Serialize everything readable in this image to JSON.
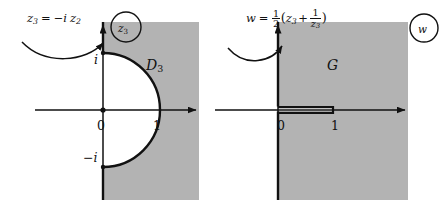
{
  "diagram": {
    "colors": {
      "region_fill": "#b3b3b3",
      "stroke": "#111111",
      "background": "#ffffff"
    },
    "panels": [
      {
        "id": "left",
        "plane_badge": "z3",
        "region_label": "D3",
        "transform_label": "z3 = -i z2",
        "transform_parts": {
          "lhs_base": "z",
          "lhs_sub": "3",
          "equals": "=",
          "minus_i": "−i",
          "rhs_base": "z",
          "rhs_sub": "2"
        },
        "axis_labels": {
          "origin": "0",
          "one": "1",
          "i": "i",
          "minus_i": "−i"
        },
        "description": "right half-plane minus closed unit half-disk"
      },
      {
        "id": "right",
        "plane_badge": "w",
        "region_label": "G",
        "transform_label": "w = 1/2 (z3 + 1/z3)",
        "transform_parts": {
          "lhs": "w",
          "equals": "=",
          "half_num": "1",
          "half_den": "2",
          "open_paren": "(",
          "term1_base": "z",
          "term1_sub": "3",
          "plus": "+",
          "inv_num": "1",
          "inv_den_base": "z",
          "inv_den_sub": "3",
          "close_paren": ")"
        },
        "axis_labels": {
          "origin": "0",
          "one": "1"
        },
        "description": "right half-plane minus slit from 0 to 1"
      }
    ]
  }
}
